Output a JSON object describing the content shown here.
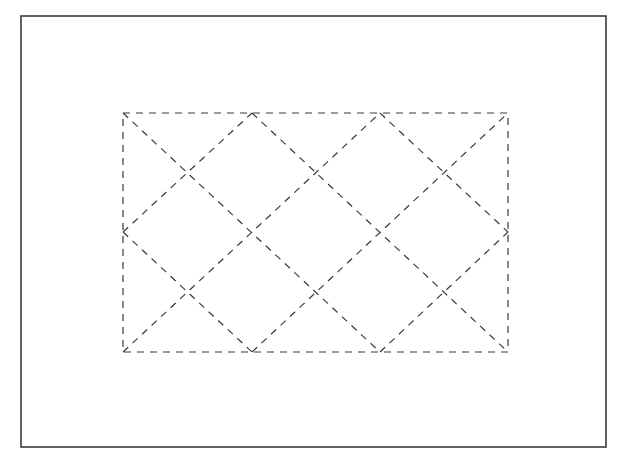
{
  "figure": {
    "background": "#ffffff",
    "stroke_color": "#3a3a3a",
    "frame": {
      "x": 21,
      "y": 16,
      "width": 585,
      "height": 431
    },
    "rectangle": {
      "x": 123,
      "y": 113,
      "width": 385,
      "height": 239,
      "dash": "7,6"
    },
    "grid_columns_x": [
      123,
      252,
      380,
      508
    ],
    "grid_rows_y": [
      113,
      232,
      352
    ],
    "diagonals": [
      [
        123,
        113,
        380,
        352
      ],
      [
        123,
        232,
        252,
        113
      ],
      [
        123,
        232,
        252,
        352
      ],
      [
        123,
        352,
        380,
        113
      ],
      [
        252,
        113,
        508,
        352
      ],
      [
        380,
        113,
        508,
        232
      ],
      [
        252,
        352,
        508,
        113
      ],
      [
        380,
        352,
        508,
        232
      ]
    ]
  }
}
